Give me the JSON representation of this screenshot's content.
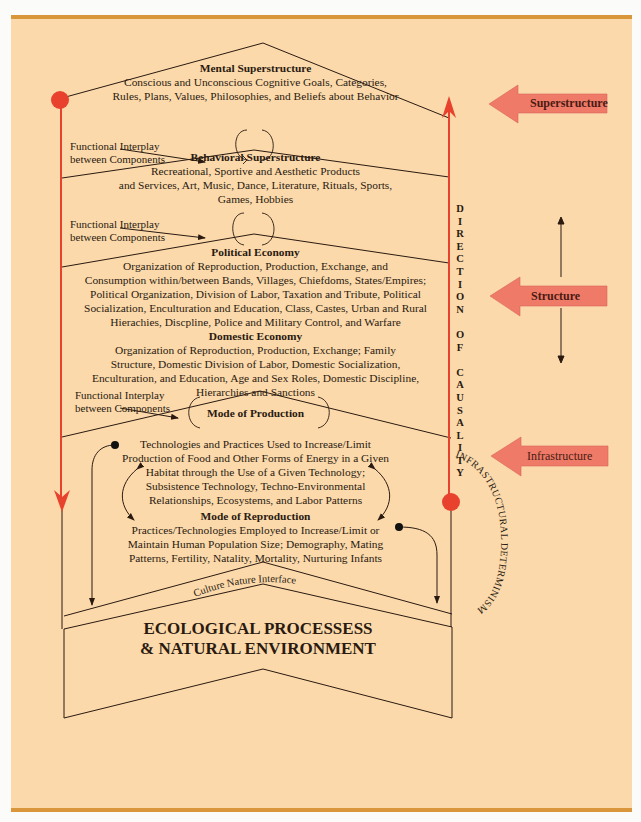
{
  "colors": {
    "background": "#fbd9ab",
    "rule": "#d9963a",
    "red": "#e8412d",
    "arrow_fill": "#ef7a68",
    "ink": "#2a1a10"
  },
  "layers": {
    "mental": {
      "title": "Mental Superstructure",
      "lines": [
        "Conscious and Unconscious Cognitive Goals, Categories,",
        "Rules, Plans, Values, Philosophies, and Beliefs about Behavior"
      ]
    },
    "behavioral": {
      "title": "Behavioral Superstructure",
      "lines": [
        "Recreational, Sportive and Aesthetic Products",
        "and Services, Art, Music, Dance, Literature, Rituals, Sports,",
        "Games, Hobbies"
      ]
    },
    "political": {
      "title": "Political Economy",
      "lines": [
        "Organization of Reproduction, Production, Exchange, and",
        "Consumption within/between Bands, Villages, Chiefdoms, States/Empires;",
        "Political Organization, Division of Labor, Taxation and Tribute, Political",
        "Socialization, Enculturation and Education, Class, Castes, Urban and Rural",
        "Hierachies, Discpline, Police and Military Control, and Warfare"
      ]
    },
    "domestic": {
      "title": "Domestic Economy",
      "lines": [
        "Organization of Reproduction, Production, Exchange; Family",
        "Structure, Domestic Division of Labor, Domestic Socialization,",
        "Enculturation, and Education, Age and Sex Roles, Domestic Discipline,",
        "Hierarchies and Sanctions"
      ]
    },
    "production": {
      "title": "Mode of Production",
      "lines": [
        "Technologies and Practices Used to Increase/Limit",
        "Production of Food and Other Forms of Energy in a Given",
        "Habitat through the Use of a Given Technology;",
        "Subsistence Technology, Techno-Environmental",
        "Relationships, Ecosystems, and Labor Patterns"
      ]
    },
    "reproduction": {
      "title": "Mode of Reproduction",
      "lines": [
        "Practices/Technologies Employed to Increase/Limit or",
        "Maintain Human Population Size; Demography, Mating",
        "Patterns, Fertility, Natality, Mortality, Nurturing Infants"
      ]
    },
    "ecological": {
      "lines": [
        "ECOLOGICAL PROCESSESS",
        "& NATURAL ENVIRONMENT"
      ]
    }
  },
  "interplay_label": [
    "Functional Interplay",
    "between Components"
  ],
  "culture_nature_interface": "Culture Nature Interface",
  "direction_of_causality": [
    "D",
    "I",
    "R",
    "E",
    "C",
    "T",
    "I",
    "O",
    "N",
    "",
    "O",
    "F",
    "",
    "C",
    "A",
    "U",
    "S",
    "A",
    "L",
    "I",
    "T",
    "Y"
  ],
  "infrastructural_determinism": "INFRASTRUCTURAL DETERMINISM",
  "side_labels": {
    "superstructure": "Superstructure",
    "structure": "Structure",
    "infrastructure": "Infrastructure"
  }
}
